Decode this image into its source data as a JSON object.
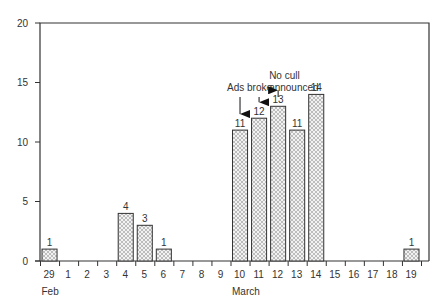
{
  "chart_data": {
    "type": "bar",
    "title": "",
    "xlabel": "",
    "ylabel": "",
    "ylim": [
      0,
      20
    ],
    "yticks": [
      0,
      5,
      10,
      15,
      20
    ],
    "grid": false,
    "legend": null,
    "categories": [
      "29",
      "1",
      "2",
      "3",
      "4",
      "5",
      "6",
      "7",
      "8",
      "9",
      "10",
      "11",
      "12",
      "13",
      "14",
      "15",
      "16",
      "17",
      "18",
      "19"
    ],
    "values": [
      1,
      0,
      0,
      0,
      4,
      3,
      1,
      0,
      0,
      0,
      11,
      12,
      13,
      11,
      14,
      0,
      0,
      0,
      0,
      1
    ],
    "month_labels": [
      {
        "label": "Feb",
        "at_index": 0
      },
      {
        "label": "March",
        "at_index": 10
      }
    ],
    "annotations": [
      {
        "text": "Ads broke",
        "lines": [
          "Ads broke"
        ],
        "arrows_to": [
          "10",
          "11"
        ]
      },
      {
        "text": "No cull announced",
        "lines": [
          "No cull",
          "announced"
        ],
        "arrows_to": [
          "12"
        ]
      }
    ],
    "bar_fill": "crosshatch",
    "bar_color": "#cccccc",
    "line_color": "#333333"
  }
}
